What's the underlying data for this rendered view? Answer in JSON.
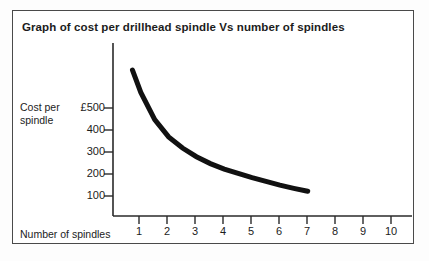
{
  "chart_data": {
    "type": "line",
    "title": "Graph of cost per drillhead spindle Vs number of spindles",
    "xlabel": "Number of spindles",
    "ylabel": "Cost per spindle",
    "ylabel_line1": "Cost per",
    "ylabel_line2": "spindle",
    "currency_symbol": "£",
    "x": [
      0.7,
      1,
      1.5,
      2,
      2.5,
      3,
      3.5,
      4,
      4.5,
      5,
      5.5,
      6,
      6.5,
      7
    ],
    "values": [
      590,
      500,
      390,
      320,
      275,
      240,
      212,
      190,
      172,
      155,
      140,
      125,
      112,
      100
    ],
    "xticks": [
      1,
      2,
      3,
      4,
      5,
      6,
      7,
      8,
      9,
      10
    ],
    "xtick_labels": [
      "1",
      "2",
      "3",
      "4",
      "5",
      "6",
      "7",
      "8",
      "9",
      "10"
    ],
    "yticks": [
      500,
      400,
      300,
      200,
      100
    ],
    "ytick_labels": [
      "£500",
      "400",
      "300",
      "200",
      "100"
    ],
    "xlim": [
      0,
      10.75
    ],
    "ylim": [
      0,
      700
    ],
    "grid": false,
    "legend": null,
    "series": [
      {
        "name": "Cost per spindle",
        "x": [
          0.7,
          1,
          1.5,
          2,
          2.5,
          3,
          3.5,
          4,
          4.5,
          5,
          5.5,
          6,
          6.5,
          7
        ],
        "values": [
          590,
          500,
          390,
          320,
          275,
          240,
          212,
          190,
          172,
          155,
          140,
          125,
          112,
          100
        ],
        "color": "#111111",
        "line_width_px": 5
      }
    ],
    "curve_color": "#111111",
    "axis_color": "#2a2a2a",
    "frame_color": "#4a4a4a",
    "background_color": "#ffffff"
  }
}
